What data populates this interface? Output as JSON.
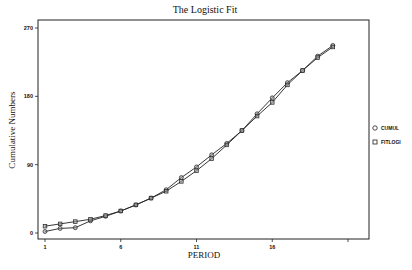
{
  "chart_data": {
    "type": "line",
    "title": "The Logistic Fit",
    "xlabel": "PERIOD",
    "ylabel": "Cumulative Numbers",
    "x": [
      1,
      2,
      3,
      4,
      5,
      6,
      7,
      8,
      9,
      10,
      11,
      12,
      13,
      14,
      15,
      16,
      17,
      18,
      19,
      20
    ],
    "series": [
      {
        "name": "CUMUL",
        "marker": "circle",
        "values": [
          2,
          6,
          7,
          16,
          22,
          29,
          37,
          46,
          57,
          73,
          87,
          103,
          118,
          135,
          157,
          178,
          198,
          214,
          233,
          247
        ]
      },
      {
        "name": "FITLOGI",
        "marker": "square",
        "values": [
          9,
          12,
          15,
          18,
          23,
          29,
          37,
          46,
          55,
          68,
          82,
          98,
          116,
          135,
          154,
          172,
          195,
          214,
          231,
          245
        ]
      }
    ],
    "xticks": [
      1,
      6,
      11,
      16,
      21
    ],
    "xtick_labels": [
      "1",
      "6",
      "11",
      "16",
      ""
    ],
    "yticks": [
      0,
      90,
      180,
      270
    ],
    "ytick_labels": [
      "0",
      "90",
      "180",
      "270"
    ],
    "xlim": [
      1,
      21
    ],
    "ylim": [
      0,
      270
    ],
    "grid": false,
    "legend_position": "right"
  },
  "colors": {
    "line": "#222222",
    "marker_fill": "#9a9a9a",
    "frame": "#222222",
    "background": "#ffffff"
  }
}
